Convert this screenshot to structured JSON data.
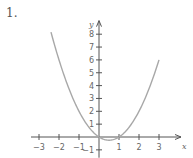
{
  "problem_number": "1.",
  "colors": {
    "axis": "#555555",
    "curve": "#a8a8a8",
    "text": "#666666",
    "background": "#ffffff"
  },
  "chart_data": {
    "type": "line",
    "title": "",
    "function": "y = x^2 - x",
    "xlabel": "x",
    "ylabel": "y",
    "xlim": [
      -3.3,
      3.9
    ],
    "ylim": [
      -1.3,
      8.9
    ],
    "grid": false,
    "x_ticks": [
      -3,
      -2,
      -1,
      1,
      2,
      3
    ],
    "x_tick_labels": [
      "−3",
      "−2",
      "−1",
      "1",
      "2",
      "3"
    ],
    "y_ticks": [
      -1,
      1,
      2,
      3,
      4,
      5,
      6,
      7,
      8
    ],
    "y_tick_labels": [
      "−1",
      "1",
      "2",
      "3",
      "4",
      "5",
      "6",
      "7",
      "8"
    ],
    "series": [
      {
        "name": "y = x^2 - x",
        "x": [
          -2.4,
          -2,
          -1.5,
          -1,
          -0.5,
          0,
          0.5,
          1,
          1.5,
          2,
          2.5,
          3
        ],
        "y": [
          8.16,
          6,
          3.75,
          2,
          0.75,
          0,
          -0.25,
          0,
          0.75,
          2,
          3.75,
          6
        ]
      }
    ]
  }
}
